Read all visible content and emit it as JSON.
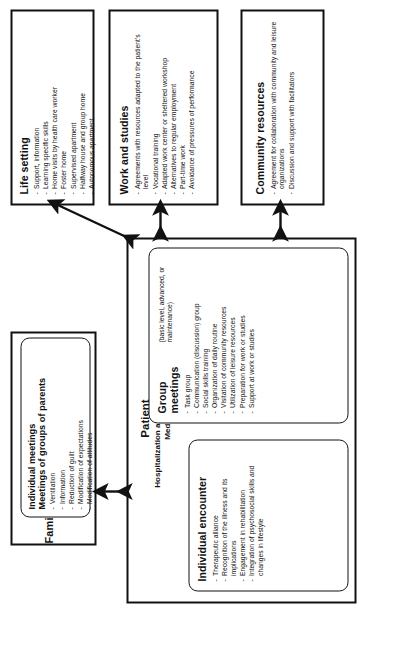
{
  "diagram": {
    "orientation": "rotated-90-ccw",
    "line_color": "#111111",
    "background": "#ffffff"
  },
  "patient": {
    "title": "Patient",
    "subtitle_1": "Hospitalization and outpatient clinic",
    "subtitle_2": "Medication",
    "individual_encounter": {
      "heading": "Individual encounter",
      "items": [
        "Therapeutic alliance",
        "Recognition of the illness and its implications",
        "Engagement in rehabilitation",
        "Integration of psychosocial skills and changes in lifestyle"
      ]
    },
    "group_meetings": {
      "heading": "Group meetings",
      "note": "(basic level, advanced, or maintenance)",
      "items": [
        "Task group",
        "Communication (discussion) group",
        "Social skills training",
        "Organization of daily routine",
        "Visitation of community resources",
        "Utilization of leisure resources",
        "Preparation for work or studies",
        "Support at work or studies"
      ]
    }
  },
  "family": {
    "title": "Family",
    "heading_1": "Individual meetings",
    "heading_2": "Meetings of groups of parents",
    "items": [
      "Ventilation",
      "Information",
      "Reduction of guilt",
      "Modification of expectations",
      "Modification of attitudes"
    ]
  },
  "life_setting": {
    "title": "Life setting",
    "items": [
      "Support, information",
      "Learning specific skills",
      "Home visits by health care worker",
      "Foster home",
      "Supervised apartment",
      "Halfway house and group home",
      "Autonomous apartment"
    ]
  },
  "work_and_studies": {
    "title": "Work and studies",
    "items": [
      "Agreements with resources adapted to the patient's level",
      "Vocational training",
      "Adapted work center or sheltered workshop",
      "Alternatives to regular employment",
      "Part-time work",
      "Avoidance of pressures of performance"
    ]
  },
  "community_resources": {
    "title": "Community resources",
    "items": [
      "Agreement for collaboration with community and leisure organizations",
      "Discussion and support with facilitators"
    ]
  },
  "connectors": [
    {
      "name": "patient-family",
      "style": "double-headed",
      "direction": "vertical"
    },
    {
      "name": "patient-life-setting",
      "style": "double-headed",
      "direction": "diagonal"
    },
    {
      "name": "patient-work-studies",
      "style": "double-headed",
      "direction": "horizontal"
    },
    {
      "name": "patient-community-resources",
      "style": "double-headed",
      "direction": "horizontal"
    }
  ]
}
